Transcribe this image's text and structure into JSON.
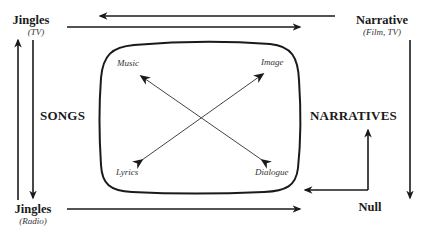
{
  "nodes": {
    "jingles_tv": {
      "title": "Jingles",
      "subtitle": "(TV)"
    },
    "narrative_film_tv": {
      "title": "Narrative",
      "subtitle": "(Film, TV)"
    },
    "jingles_radio": {
      "title": "Jingles",
      "subtitle": "(Radio)"
    },
    "null": {
      "title": "Null"
    }
  },
  "categories": {
    "left": "SONGS",
    "right": "NARRATIVES"
  },
  "box_corners": {
    "top_left": "Music",
    "top_right": "Image",
    "bottom_left": "Lyrics",
    "bottom_right": "Dialogue"
  },
  "colors": {
    "line": "#1a1a1a",
    "diagonal": "#444444",
    "background": "#ffffff"
  }
}
